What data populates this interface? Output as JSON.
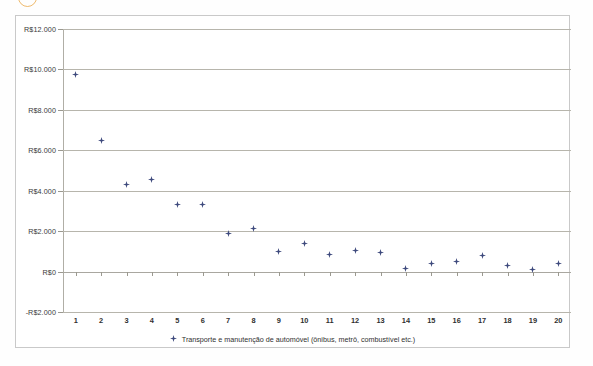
{
  "decoration": {
    "corner_mark": "orange-circle-annotation"
  },
  "chart_data": {
    "type": "scatter",
    "title": "",
    "subtitle": "",
    "xlabel": "",
    "ylabel": "",
    "grid": true,
    "legend_position": "bottom",
    "currency_prefix": "R$",
    "x": [
      1,
      2,
      3,
      4,
      5,
      6,
      7,
      8,
      9,
      10,
      11,
      12,
      13,
      14,
      15,
      16,
      17,
      18,
      19,
      20
    ],
    "xtick_labels": [
      "1",
      "2",
      "3",
      "4",
      "5",
      "6",
      "7",
      "8",
      "9",
      "10",
      "11",
      "12",
      "13",
      "14",
      "15",
      "16",
      "17",
      "18",
      "19",
      "20"
    ],
    "xlim": [
      0.5,
      20.5
    ],
    "ylim": [
      -2000,
      12000
    ],
    "ytick_values": [
      12000,
      10000,
      8000,
      6000,
      4000,
      2000,
      0,
      -2000
    ],
    "ytick_labels": [
      "R$12.000",
      "R$10.000",
      "R$8.000",
      "R$6.000",
      "R$4.000",
      "R$2.000",
      "R$0",
      "-R$2.000"
    ],
    "series": [
      {
        "name": "Transporte e manutenção de automóvel (ônibus, metrô, combustível etc.)",
        "marker": "diamond",
        "color": "#3e4a7d",
        "values": [
          9750,
          6500,
          4300,
          4550,
          3300,
          3300,
          1900,
          2150,
          1000,
          1400,
          850,
          1050,
          950,
          130,
          400,
          500,
          800,
          300,
          100,
          400
        ]
      }
    ]
  },
  "legend": {
    "entries": [
      {
        "label": "Transporte e manutenção de automóvel (ônibus, metrô, combustível etc.)",
        "marker": "diamond-marker",
        "color": "#3e4a7d"
      }
    ]
  }
}
